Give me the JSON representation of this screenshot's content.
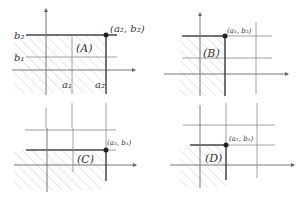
{
  "colors": {
    "line": "#777777",
    "bold_line": "#444444",
    "hatch": "#cfcfcf",
    "point": "#222222",
    "text": "#333333"
  },
  "panels": [
    {
      "id": "A",
      "name": "(A)",
      "point_label": "(a₂, b₂)",
      "axis_labels": {
        "a1": "a₁",
        "a2": "a₂",
        "b1": "b₁",
        "b2": "b₂"
      },
      "shaded_region": "x ≤ a₂, y ≤ b₂"
    },
    {
      "id": "B",
      "name": "(B)",
      "point_label": "(a₁, b₂)",
      "shaded_region": "x ≤ a₁, y ≤ b₂"
    },
    {
      "id": "C",
      "name": "(C)",
      "point_label": "(a₂, b₁)",
      "shaded_region": "x ≤ a₂, y ≤ b₁"
    },
    {
      "id": "D",
      "name": "(D)",
      "point_label": "(a₁, b₁)",
      "shaded_region": "x ≤ a₁, y ≤ b₁"
    }
  ]
}
